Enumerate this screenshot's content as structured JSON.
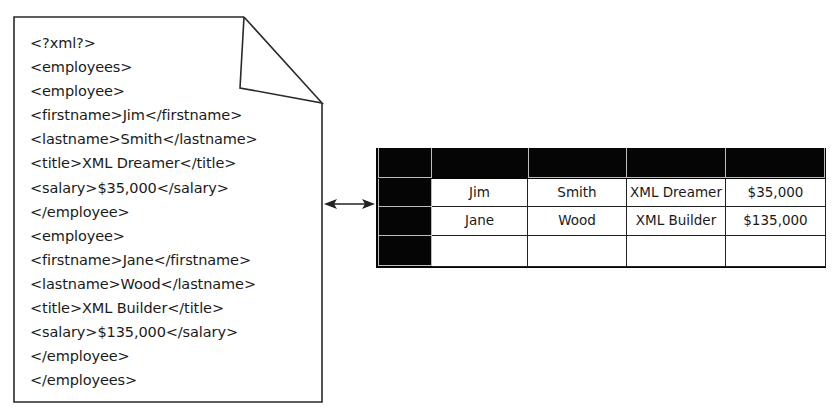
{
  "xml_document": {
    "lines": [
      "<?xml?>",
      "<employees>",
      "<employee>",
      "<firstname>Jim</firstname>",
      "<lastname>Smith</lastname>",
      "<title>XML Dreamer</title>",
      "<salary>$35,000</salary>",
      "</employee>",
      "<employee>",
      "<firstname>Jane</firstname>",
      "<lastname>Wood</lastname>",
      "<title>XML Builder</title>",
      "<salary>$135,000</salary>",
      "</employee>",
      "</employees>"
    ]
  },
  "connector": {
    "icon": "double-headed-arrow-icon"
  },
  "table": {
    "header_fill": "#050505",
    "rows": [
      [
        "Jim",
        "Smith",
        "XML Dreamer",
        "$35,000"
      ],
      [
        "Jane",
        "Wood",
        "XML Builder",
        "$135,000"
      ],
      [
        "",
        "",
        "",
        ""
      ]
    ]
  }
}
